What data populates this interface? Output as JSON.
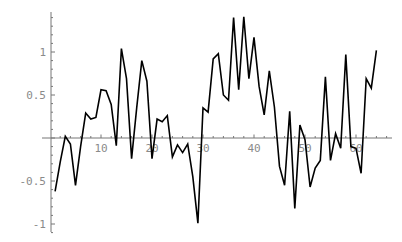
{
  "chart_data": {
    "type": "line",
    "title": "",
    "xlabel": "",
    "ylabel": "",
    "xlim": [
      0,
      66
    ],
    "ylim": [
      -1.1,
      1.45
    ],
    "grid": false,
    "legend": null,
    "x_ticks": [
      10,
      20,
      30,
      40,
      50,
      60
    ],
    "x_tick_labels": [
      "10",
      "20",
      "30",
      "40",
      "50",
      "60"
    ],
    "y_ticks": [
      -1,
      -0.5,
      0.5,
      1
    ],
    "y_tick_labels": [
      "-1",
      "-0.5",
      "0.5",
      "1"
    ],
    "series": [
      {
        "name": "series-1",
        "color": "#000000",
        "x": [
          1,
          2,
          3,
          4,
          5,
          6,
          7,
          8,
          9,
          10,
          11,
          12,
          13,
          14,
          15,
          16,
          17,
          18,
          19,
          20,
          21,
          22,
          23,
          24,
          25,
          26,
          27,
          28,
          29,
          30,
          31,
          32,
          33,
          34,
          35,
          36,
          37,
          38,
          39,
          40,
          41,
          42,
          43,
          44,
          45,
          46,
          47,
          48,
          49,
          50,
          51,
          52,
          53,
          54,
          55,
          56,
          57,
          58,
          59,
          60,
          61,
          62,
          63,
          64
        ],
        "values": [
          -0.62,
          -0.28,
          0.02,
          -0.07,
          -0.55,
          -0.1,
          0.29,
          0.22,
          0.24,
          0.56,
          0.55,
          0.39,
          -0.09,
          1.04,
          0.69,
          -0.24,
          0.35,
          0.9,
          0.66,
          -0.24,
          0.22,
          0.19,
          0.26,
          -0.22,
          -0.08,
          -0.17,
          -0.07,
          -0.45,
          -0.99,
          0.35,
          0.3,
          0.92,
          0.98,
          0.5,
          0.44,
          1.4,
          0.56,
          1.41,
          0.69,
          1.17,
          0.6,
          0.27,
          0.78,
          0.36,
          -0.33,
          -0.55,
          0.31,
          -0.82,
          0.15,
          -0.02,
          -0.57,
          -0.35,
          -0.26,
          0.71,
          -0.26,
          0.05,
          -0.12,
          0.97,
          -0.1,
          -0.12,
          -0.41,
          0.69,
          0.58,
          1.02
        ]
      }
    ]
  }
}
